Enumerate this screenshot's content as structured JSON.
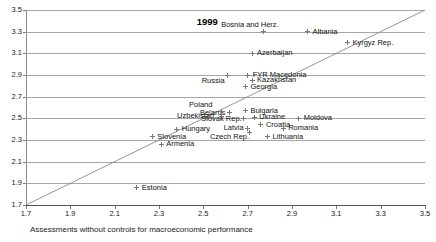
{
  "chart_data": {
    "type": "scatter",
    "title": "",
    "annotation": "1999",
    "xlabel": "Assessments without controls for macroeconomic performance",
    "ylabel": "",
    "xlim": [
      1.7,
      3.5
    ],
    "ylim": [
      1.7,
      3.5
    ],
    "xticks": [
      "1.7",
      "1.9",
      "2.1",
      "2.3",
      "2.5",
      "2.7",
      "2.9",
      "3.1",
      "3.3",
      "3.5"
    ],
    "yticks": [
      "1.7",
      "1.9",
      "2.1",
      "2.3",
      "2.5",
      "2.7",
      "2.9",
      "3.1",
      "3.3",
      "3.5"
    ],
    "grid": "horizontal",
    "legend": "none",
    "reference_line": {
      "type": "identity",
      "label": "45-degree line",
      "from": [
        1.7,
        1.7
      ],
      "to": [
        3.5,
        3.5
      ]
    },
    "points": [
      {
        "label": "Bosnia and Herz.",
        "x": 2.77,
        "y": 3.3,
        "label_dx": -42,
        "label_dy": -11
      },
      {
        "label": "Albania",
        "x": 2.97,
        "y": 3.3,
        "label_dx": 5,
        "label_dy": -4
      },
      {
        "label": "Kyrgyz Rep.",
        "x": 3.15,
        "y": 3.2,
        "label_dx": 5,
        "label_dy": -4
      },
      {
        "label": "Azerbaijan",
        "x": 2.72,
        "y": 3.1,
        "label_dx": 5,
        "label_dy": -4
      },
      {
        "label": "FYR Macedonia",
        "x": 2.7,
        "y": 2.9,
        "label_dx": 5,
        "label_dy": -4
      },
      {
        "label": "Russia",
        "x": 2.61,
        "y": 2.9,
        "label_dx": -26,
        "label_dy": 2
      },
      {
        "label": "Kazakhstan",
        "x": 2.72,
        "y": 2.85,
        "label_dx": 5,
        "label_dy": -4
      },
      {
        "label": "Georgia",
        "x": 2.69,
        "y": 2.79,
        "label_dx": 5,
        "label_dy": -4
      },
      {
        "label": "Bulgaria",
        "x": 2.69,
        "y": 2.57,
        "label_dx": 5,
        "label_dy": -4
      },
      {
        "label": "Belarus",
        "x": 2.62,
        "y": 2.55,
        "label_dx": -30,
        "label_dy": 0
      },
      {
        "label": "Poland",
        "x": 2.58,
        "y": 2.56,
        "label_dx": -32,
        "label_dy": -11
      },
      {
        "label": "Uzbekistan",
        "x": 2.58,
        "y": 2.52,
        "label_dx": -44,
        "label_dy": -4
      },
      {
        "label": "Slovak Rep.",
        "x": 2.68,
        "y": 2.5,
        "label_dx": -42,
        "label_dy": -3
      },
      {
        "label": "Ukraine",
        "x": 2.73,
        "y": 2.51,
        "label_dx": 5,
        "label_dy": -4
      },
      {
        "label": "Moldova",
        "x": 2.93,
        "y": 2.5,
        "label_dx": 5,
        "label_dy": -4
      },
      {
        "label": "Croatia",
        "x": 2.76,
        "y": 2.44,
        "label_dx": 5,
        "label_dy": -4
      },
      {
        "label": "Romania",
        "x": 2.86,
        "y": 2.41,
        "label_dx": 5,
        "label_dy": -4
      },
      {
        "label": "Latvia",
        "x": 2.7,
        "y": 2.41,
        "label_dx": -24,
        "label_dy": 0
      },
      {
        "label": "Czech Rep.",
        "x": 2.71,
        "y": 2.37,
        "label_dx": -40,
        "label_dy": 1
      },
      {
        "label": "Hungary",
        "x": 2.38,
        "y": 2.4,
        "label_dx": 5,
        "label_dy": -4
      },
      {
        "label": "Lithuania",
        "x": 2.79,
        "y": 2.33,
        "label_dx": 5,
        "label_dy": -4
      },
      {
        "label": "Slovenia",
        "x": 2.27,
        "y": 2.33,
        "label_dx": 5,
        "label_dy": -4
      },
      {
        "label": "Armenia",
        "x": 2.31,
        "y": 2.26,
        "label_dx": 5,
        "label_dy": -4
      },
      {
        "label": "Estonia",
        "x": 2.2,
        "y": 1.86,
        "label_dx": 5,
        "label_dy": -4
      }
    ]
  }
}
